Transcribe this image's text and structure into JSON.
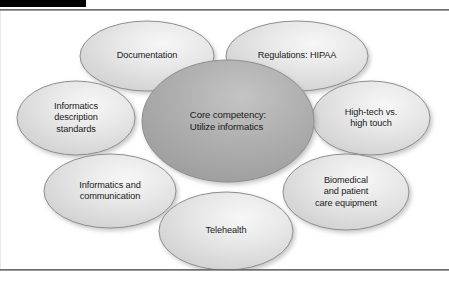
{
  "figure": {
    "title": "Core competency: Utilize informatics",
    "type": "hub-and-spoke concept diagram",
    "colors": {
      "center_fill": "#a9a9a9",
      "center_highlight": "#c3c3c3",
      "satellite_fill": "#dcdcdc",
      "satellite_highlight": "#f4f4f4",
      "stroke": "#8e8e8e",
      "text": "#1a1a1a",
      "rule": "#6d6d6d",
      "black_bar": "#000000",
      "background": "#ffffff"
    }
  },
  "center": {
    "id": "core-competency",
    "label": "Core competency:\nUtilize informatics",
    "cx": 228,
    "cy": 110,
    "rx": 86,
    "ry": 61
  },
  "satellites": [
    {
      "id": "documentation",
      "label": "Documentation",
      "cx": 147,
      "cy": 45,
      "rx": 67,
      "ry": 35
    },
    {
      "id": "regulations-hipaa",
      "label": "Regulations: HIPAA",
      "cx": 297,
      "cy": 45,
      "rx": 71,
      "ry": 35
    },
    {
      "id": "informatics-description-standards",
      "label": "Informatics\ndescription\nstandards",
      "cx": 76,
      "cy": 107,
      "rx": 59,
      "ry": 37
    },
    {
      "id": "high-tech-vs-high-touch",
      "label": "High-tech vs.\nhigh touch",
      "cx": 371,
      "cy": 107,
      "rx": 59,
      "ry": 37
    },
    {
      "id": "informatics-and-communication",
      "label": "Informatics and\ncommunication",
      "cx": 110,
      "cy": 180,
      "rx": 66,
      "ry": 37
    },
    {
      "id": "biomedical-and-patient-care-equipment",
      "label": "Biomedical\nand patient\ncare equipment",
      "cx": 346,
      "cy": 181,
      "rx": 63,
      "ry": 38
    },
    {
      "id": "telehealth",
      "label": "Telehealth",
      "cx": 226,
      "cy": 220,
      "rx": 67,
      "ry": 39
    }
  ]
}
